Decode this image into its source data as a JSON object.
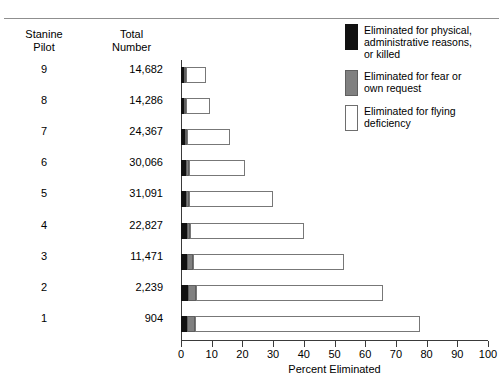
{
  "table": {
    "header": {
      "col1_line1": "Stanine",
      "col1_line2": "Pilot",
      "col2_line1": "Total",
      "col2_line2": "Number"
    },
    "rows": [
      {
        "stanine": "9",
        "total": "14,682"
      },
      {
        "stanine": "8",
        "total": "14,286"
      },
      {
        "stanine": "7",
        "total": "24,367"
      },
      {
        "stanine": "6",
        "total": "30,066"
      },
      {
        "stanine": "5",
        "total": "31,091"
      },
      {
        "stanine": "4",
        "total": "22,827"
      },
      {
        "stanine": "3",
        "total": "11,471"
      },
      {
        "stanine": "2",
        "total": "2,239"
      },
      {
        "stanine": "1",
        "total": "904"
      }
    ]
  },
  "legend": {
    "position": "top-right",
    "items": [
      {
        "swatch": "black-swatch",
        "color": "#111111",
        "line1": "Eliminated for physical,",
        "line2": "administrative reasons,",
        "line3": "or killed"
      },
      {
        "swatch": "gray-swatch",
        "color": "#808080",
        "line1": "Eliminated for fear or",
        "line2": "own request",
        "line3": ""
      },
      {
        "swatch": "white-swatch",
        "color": "#ffffff",
        "line1": "Eliminated for flying",
        "line2": "deficiency",
        "line3": ""
      }
    ]
  },
  "axis": {
    "x_ticks": [
      "0",
      "10",
      "20",
      "30",
      "40",
      "50",
      "60",
      "70",
      "80",
      "90",
      "100"
    ],
    "x_label": "Percent Eliminated"
  },
  "chart_data": {
    "type": "bar",
    "orientation": "horizontal",
    "stacked": true,
    "title": "",
    "xlabel": "Percent Eliminated",
    "ylabel": "",
    "xlim": [
      0,
      100
    ],
    "grid": false,
    "legend_position": "top-right",
    "categories": [
      "9",
      "8",
      "7",
      "6",
      "5",
      "4",
      "3",
      "2",
      "1"
    ],
    "category_totals": [
      "14,682",
      "14,286",
      "24,367",
      "30,066",
      "31,091",
      "22,827",
      "11,471",
      "2,239",
      "904"
    ],
    "series": [
      {
        "name": "Eliminated for physical, administrative reasons, or killed",
        "color": "#111111",
        "values": [
          1.0,
          1.0,
          1.2,
          1.5,
          1.5,
          1.8,
          2.0,
          2.2,
          2.0
        ]
      },
      {
        "name": "Eliminated for fear or own request",
        "color": "#808080",
        "values": [
          0.5,
          0.6,
          0.6,
          1.0,
          1.0,
          1.2,
          2.0,
          2.8,
          2.5
        ]
      },
      {
        "name": "Eliminated for flying deficiency",
        "color": "#ffffff",
        "values": [
          6.5,
          7.9,
          14.2,
          18.5,
          27.5,
          37.0,
          49.0,
          60.8,
          73.5
        ]
      }
    ],
    "stack_totals": [
      8.0,
      9.5,
      16.0,
      21.0,
      30.0,
      40.0,
      53.0,
      65.8,
      78.0
    ]
  }
}
